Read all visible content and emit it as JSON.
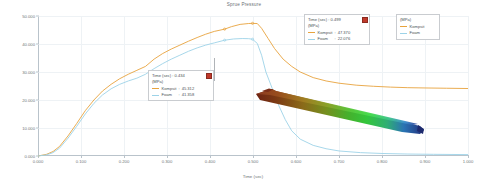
{
  "chart_data": {
    "type": "line",
    "title": "Sprue Pressure",
    "xlabel": "Time (sec)",
    "ylabel": "(MPa)",
    "xlim": [
      0.0,
      1.0
    ],
    "ylim": [
      0.0,
      50.0
    ],
    "grid": true,
    "legend_position": "top-right",
    "xticks": [
      "0.000",
      "0.100",
      "0.200",
      "0.300",
      "0.400",
      "0.500",
      "0.600",
      "0.700",
      "0.800",
      "0.900",
      "1.000"
    ],
    "yticks": [
      "0.000",
      "10.000",
      "20.000",
      "30.000",
      "40.000",
      "50.000"
    ],
    "series": [
      {
        "name": "Kompsit",
        "color": "#e8a33d",
        "x": [
          0.0,
          0.02,
          0.035,
          0.05,
          0.07,
          0.09,
          0.11,
          0.13,
          0.15,
          0.17,
          0.19,
          0.21,
          0.23,
          0.25,
          0.27,
          0.29,
          0.31,
          0.33,
          0.35,
          0.37,
          0.39,
          0.41,
          0.434,
          0.45,
          0.47,
          0.49,
          0.499,
          0.51,
          0.52,
          0.535,
          0.55,
          0.57,
          0.59,
          0.61,
          0.64,
          0.67,
          0.7,
          0.74,
          0.78,
          0.82,
          0.86,
          0.9,
          0.95,
          1.0
        ],
        "y": [
          0.0,
          0.6,
          1.6,
          3.4,
          7.2,
          11.6,
          16.2,
          20.0,
          23.2,
          25.6,
          27.6,
          29.2,
          30.6,
          32.0,
          34.6,
          36.6,
          38.2,
          39.6,
          41.0,
          42.3,
          43.5,
          44.5,
          45.31,
          46.2,
          47.0,
          47.32,
          47.37,
          47.3,
          45.6,
          42.0,
          38.4,
          34.6,
          32.0,
          30.0,
          28.0,
          26.8,
          26.0,
          25.3,
          24.9,
          24.6,
          24.4,
          24.3,
          24.2,
          24.1
        ]
      },
      {
        "name": "Foam",
        "color": "#9dd3e8",
        "x": [
          0.0,
          0.02,
          0.035,
          0.05,
          0.07,
          0.09,
          0.11,
          0.13,
          0.15,
          0.17,
          0.19,
          0.21,
          0.23,
          0.25,
          0.27,
          0.29,
          0.31,
          0.33,
          0.35,
          0.37,
          0.39,
          0.41,
          0.434,
          0.455,
          0.475,
          0.49,
          0.499,
          0.51,
          0.52,
          0.53,
          0.545,
          0.56,
          0.575,
          0.59,
          0.61,
          0.64,
          0.67,
          0.7,
          0.75,
          0.8,
          0.86,
          0.92,
          1.0
        ],
        "y": [
          0.0,
          0.4,
          1.2,
          2.8,
          6.4,
          10.6,
          15.0,
          18.8,
          21.8,
          24.0,
          25.6,
          26.8,
          27.8,
          29.2,
          31.2,
          33.0,
          34.6,
          36.0,
          37.4,
          38.6,
          39.6,
          40.4,
          41.36,
          41.8,
          41.95,
          41.9,
          41.7,
          40.2,
          36.0,
          30.0,
          24.0,
          18.0,
          13.0,
          9.0,
          6.0,
          3.8,
          2.6,
          1.8,
          1.2,
          0.9,
          0.7,
          0.6,
          0.5
        ]
      }
    ]
  },
  "legend": {
    "unit": "(MPa)",
    "items": [
      {
        "label": "Kompsit",
        "color": "#e8a33d"
      },
      {
        "label": "Foam",
        "color": "#9dd3e8"
      }
    ]
  },
  "tooltips": [
    {
      "time_label": "Time (sec) :  0.434",
      "unit": "(MPa)",
      "rows": [
        {
          "name": "Kompsit",
          "sep": ":",
          "value": "45.312",
          "color": "#e8a33d"
        },
        {
          "name": "Foam",
          "sep": ":",
          "value": "41.358",
          "color": "#9dd3e8"
        }
      ],
      "close_icon": "close-box-icon"
    },
    {
      "time_label": "Time (sec) :  0.499",
      "unit": "(MPa)",
      "rows": [
        {
          "name": "Kompsit",
          "sep": ":",
          "value": "47.370",
          "color": "#e8a33d"
        },
        {
          "name": "Foam",
          "sep": ":",
          "value": "22.076",
          "color": "#9dd3e8"
        }
      ],
      "close_icon": "close-box-icon"
    }
  ],
  "model": {
    "name": "part-3d-model",
    "colors": [
      "#7a2a18",
      "#8a4a18",
      "#7d7a1e",
      "#4e8f28",
      "#35c03a",
      "#2fae7a",
      "#2a6fb0",
      "#23307a"
    ]
  }
}
